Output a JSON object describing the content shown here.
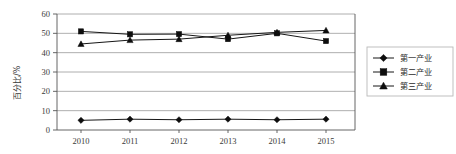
{
  "chart_data": {
    "type": "line",
    "title": "",
    "xlabel": "",
    "ylabel": "百分比/%",
    "categories": [
      "2010",
      "2011",
      "2012",
      "2013",
      "2014",
      "2015"
    ],
    "ylim": [
      0,
      60
    ],
    "yticks": [
      0,
      10,
      20,
      30,
      40,
      50,
      60
    ],
    "ytick_labels": [
      "0",
      "10",
      "20",
      "30",
      "40",
      "50",
      "60"
    ],
    "grid": true,
    "legend_position": "right",
    "series": [
      {
        "name": "第一产业",
        "marker": "diamond",
        "color": "#0d0d0d",
        "values": [
          5.0,
          5.6,
          5.3,
          5.6,
          5.3,
          5.6
        ]
      },
      {
        "name": "第二产业",
        "marker": "square",
        "color": "#0d0d0d",
        "values": [
          51.0,
          49.5,
          49.6,
          47.0,
          50.0,
          46.0
        ]
      },
      {
        "name": "第三产业",
        "marker": "triangle",
        "color": "#0d0d0d",
        "values": [
          44.5,
          46.5,
          47.0,
          49.0,
          50.5,
          51.5
        ]
      }
    ]
  },
  "axis": {
    "y_tick_0": "0",
    "y_tick_1": "10",
    "y_tick_2": "20",
    "y_tick_3": "30",
    "y_tick_4": "40",
    "y_tick_5": "50",
    "y_tick_6": "60",
    "x_tick_0": "2010",
    "x_tick_1": "2011",
    "x_tick_2": "2012",
    "x_tick_3": "2013",
    "x_tick_4": "2014",
    "x_tick_5": "2015",
    "y_axis_title": "百分比/%"
  },
  "legend": {
    "entry_0": "第一产业",
    "entry_1": "第二产业",
    "entry_2": "第三产业"
  }
}
